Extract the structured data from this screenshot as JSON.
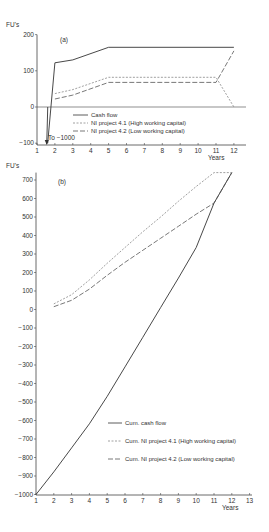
{
  "chart_data": [
    {
      "type": "line",
      "panel_label": "(a)",
      "ylabel": "FU's",
      "xlabel": "Years",
      "ylim": [
        -100,
        200
      ],
      "xlim": [
        1,
        12.8
      ],
      "yticks": [
        200,
        100,
        0,
        -100
      ],
      "xticks": [
        1,
        2,
        3,
        4,
        5,
        6,
        7,
        8,
        9,
        10,
        11,
        12
      ],
      "annotation": "To −1000",
      "series": [
        {
          "name": "Cash flow",
          "style": "solid",
          "x": [
            1.6,
            2,
            3,
            5,
            12
          ],
          "values": [
            -100,
            122,
            130,
            165,
            165
          ]
        },
        {
          "name": "NI project 4.1 (High working capital)",
          "style": "short-dash",
          "x": [
            2,
            3,
            5,
            11,
            12
          ],
          "values": [
            37,
            48,
            82,
            82,
            0
          ]
        },
        {
          "name": "NI project 4.2 (Low working capital)",
          "style": "long-dash",
          "x": [
            2,
            3,
            5,
            11,
            12
          ],
          "values": [
            22,
            33,
            68,
            68,
            155
          ]
        }
      ],
      "legend": [
        "Cash flow",
        "NI project 4.1 (High working capital)",
        "NI project 4.2 (Low working capital)"
      ]
    },
    {
      "type": "line",
      "panel_label": "(b)",
      "ylabel": "FU's",
      "xlabel": "Years",
      "ylim": [
        -1000,
        740
      ],
      "xlim": [
        1,
        13
      ],
      "yticks": [
        700,
        600,
        500,
        400,
        300,
        200,
        100,
        0,
        -100,
        -200,
        -300,
        -400,
        -500,
        -600,
        -700,
        -800,
        -900,
        -1000
      ],
      "xticks": [
        1,
        2,
        3,
        4,
        5,
        6,
        7,
        8,
        9,
        10,
        11,
        12,
        13
      ],
      "series": [
        {
          "name": "Cum. cash flow",
          "style": "solid",
          "x": [
            1,
            2,
            3,
            4,
            5,
            6,
            7,
            8,
            9,
            10,
            11,
            12
          ],
          "values": [
            -1000,
            -878,
            -748,
            -618,
            -470,
            -310,
            -150,
            10,
            170,
            335,
            575,
            740
          ]
        },
        {
          "name": "Cum. NI project 4.1 (High working capital)",
          "style": "short-dash",
          "x": [
            2,
            3,
            4,
            5,
            6,
            7,
            8,
            9,
            10,
            11,
            12
          ],
          "values": [
            30,
            80,
            160,
            250,
            335,
            420,
            500,
            585,
            665,
            740,
            740
          ]
        },
        {
          "name": "Cum. NI project 4.2 (Low working capital)",
          "style": "long-dash",
          "x": [
            2,
            3,
            4,
            5,
            6,
            7,
            8,
            9,
            10,
            11,
            12
          ],
          "values": [
            15,
            50,
            110,
            185,
            255,
            320,
            385,
            450,
            515,
            575,
            740
          ]
        }
      ],
      "legend": [
        "Cum. cash flow",
        "Cum. NI project 4.1 (High working capital)",
        "Cum. NI project 4.2 (Low working capital)"
      ]
    }
  ]
}
